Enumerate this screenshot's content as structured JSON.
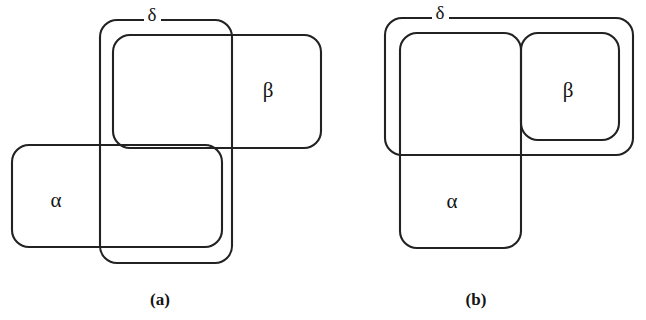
{
  "figure": {
    "type": "set-relation-diagram",
    "background_color": "#ffffff",
    "stroke_color": "#222222",
    "text_color": "#141414",
    "panels": [
      {
        "id": "a",
        "caption": "(a)",
        "caption_x": 160,
        "caption_y": 305,
        "description": "Three mutually overlapping rounded rectangles: alpha, beta and delta partially intersect each other.",
        "regions": [
          {
            "name": "delta",
            "label": "δ",
            "label_x": 152,
            "label_y": 20,
            "label_position": "on-top-edge",
            "x": 100,
            "y": 20,
            "width": 132,
            "height": 243,
            "radius": 17
          },
          {
            "name": "beta",
            "label": "β",
            "label_x": 268,
            "label_y": 92,
            "label_position": "inside-right",
            "x": 113,
            "y": 35,
            "width": 208,
            "height": 113,
            "radius": 17
          },
          {
            "name": "alpha",
            "label": "α",
            "label_x": 56,
            "label_y": 202,
            "label_position": "inside-left",
            "x": 12,
            "y": 145,
            "width": 210,
            "height": 102,
            "radius": 17
          }
        ]
      },
      {
        "id": "b",
        "caption": "(b)",
        "caption_x": 476,
        "caption_y": 305,
        "description": "Alpha and beta are adjacent sharing a common vertical boundary; delta encloses the top portion of alpha together with all of beta.",
        "regions": [
          {
            "name": "delta",
            "label": "δ",
            "label_x": 440,
            "label_y": 18,
            "label_position": "on-top-edge",
            "x": 385,
            "y": 18,
            "width": 248,
            "height": 137,
            "radius": 17
          },
          {
            "name": "beta",
            "label": "β",
            "label_x": 568,
            "label_y": 92,
            "label_position": "inside-right",
            "x": 521,
            "y": 33,
            "width": 98,
            "height": 107,
            "radius": 17
          },
          {
            "name": "alpha",
            "label": "α",
            "label_x": 452,
            "label_y": 203,
            "label_position": "inside-lower-left",
            "x": 400,
            "y": 33,
            "width": 121,
            "height": 215,
            "radius": 17
          }
        ]
      }
    ]
  }
}
